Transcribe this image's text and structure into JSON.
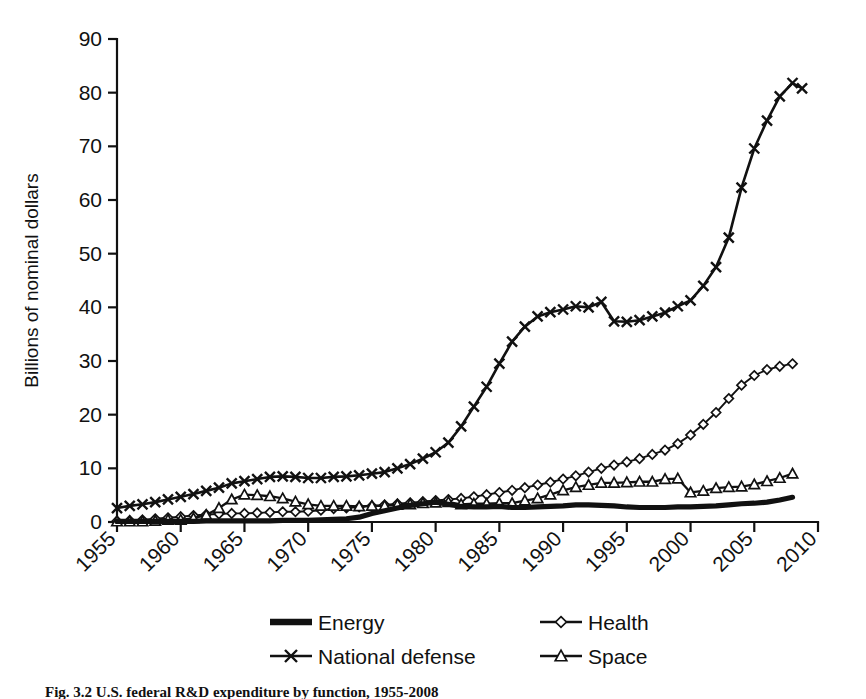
{
  "figure": {
    "background": "#ffffff",
    "ink_color": "#111111"
  },
  "axis": {
    "y_label": "Billions of nominal dollars",
    "y_ticks": [
      "0",
      "10",
      "20",
      "30",
      "40",
      "50",
      "60",
      "70",
      "80",
      "90"
    ],
    "x_ticks": [
      "1955",
      "1960",
      "1965",
      "1970",
      "1975",
      "1980",
      "1985",
      "1990",
      "1995",
      "2000",
      "2005",
      "2010"
    ]
  },
  "legend": {
    "entries": [
      {
        "label": "Energy",
        "marker": "thick-line",
        "column": 0,
        "row": 0
      },
      {
        "label": "Health",
        "marker": "diamond",
        "column": 1,
        "row": 0
      },
      {
        "label": "National defense",
        "marker": "cross-x",
        "column": 0,
        "row": 1
      },
      {
        "label": "Space",
        "marker": "triangle",
        "column": 1,
        "row": 1
      }
    ]
  },
  "caption": {
    "text": "Fig. 3.2   U.S. federal R&D expenditure by function, 1955-2008"
  },
  "chart_data": {
    "type": "line",
    "title": "",
    "xlabel": "",
    "ylabel": "Billions of nominal dollars",
    "xlim": [
      1955,
      2010
    ],
    "ylim": [
      0,
      90
    ],
    "ytick_step": 10,
    "xtick_step": 5,
    "grid": false,
    "legend_position": "bottom",
    "x": [
      1955,
      1956,
      1957,
      1958,
      1959,
      1960,
      1961,
      1962,
      1963,
      1964,
      1965,
      1966,
      1967,
      1968,
      1969,
      1970,
      1971,
      1972,
      1973,
      1974,
      1975,
      1976,
      1977,
      1978,
      1979,
      1980,
      1981,
      1982,
      1983,
      1984,
      1985,
      1986,
      1987,
      1988,
      1989,
      1990,
      1991,
      1992,
      1993,
      1994,
      1995,
      1996,
      1997,
      1998,
      1999,
      2000,
      2001,
      2002,
      2003,
      2004,
      2005,
      2006,
      2007,
      2008
    ],
    "series": [
      {
        "name": "National defense",
        "marker": "cross-x",
        "values": [
          2.6,
          3.0,
          3.3,
          3.7,
          4.2,
          4.7,
          5.2,
          5.8,
          6.4,
          7.2,
          7.6,
          8.0,
          8.4,
          8.5,
          8.4,
          8.2,
          8.2,
          8.4,
          8.5,
          8.7,
          9.0,
          9.3,
          10.0,
          10.8,
          11.8,
          13.0,
          14.8,
          17.8,
          21.5,
          25.2,
          29.5,
          33.6,
          36.4,
          38.3,
          39.1,
          39.6,
          40.2,
          40.0,
          41.0,
          37.4,
          37.3,
          37.6,
          38.3,
          39.0,
          40.2,
          41.3,
          44.0,
          47.5,
          53.0,
          62.3,
          69.6,
          74.8,
          79.3,
          81.8
        ],
        "end_value_after_peak": 80.8
      },
      {
        "name": "Health",
        "marker": "diamond",
        "values": [
          0.2,
          0.3,
          0.4,
          0.6,
          0.8,
          1.0,
          1.2,
          1.4,
          1.5,
          1.6,
          1.6,
          1.7,
          1.8,
          1.9,
          1.9,
          2.0,
          2.2,
          2.5,
          2.6,
          2.8,
          3.0,
          3.2,
          3.4,
          3.6,
          3.8,
          4.0,
          4.2,
          4.4,
          4.7,
          5.1,
          5.5,
          5.9,
          6.4,
          6.9,
          7.4,
          8.0,
          8.6,
          9.3,
          10.0,
          10.6,
          11.2,
          11.8,
          12.6,
          13.4,
          14.6,
          16.2,
          18.2,
          20.4,
          23.0,
          25.5,
          27.3,
          28.4,
          29.0,
          29.5
        ]
      },
      {
        "name": "Space",
        "marker": "triangle",
        "values": [
          0.1,
          0.1,
          0.1,
          0.2,
          0.4,
          0.4,
          0.7,
          1.3,
          2.6,
          4.2,
          5.1,
          5.0,
          4.8,
          4.4,
          3.8,
          3.3,
          3.0,
          3.0,
          3.0,
          2.9,
          3.0,
          3.0,
          3.2,
          3.3,
          3.5,
          3.6,
          3.7,
          3.3,
          3.4,
          3.4,
          3.5,
          3.5,
          4.0,
          4.4,
          5.1,
          5.9,
          6.5,
          6.9,
          7.3,
          7.3,
          7.4,
          7.5,
          7.5,
          8.0,
          8.1,
          5.5,
          5.8,
          6.3,
          6.5,
          6.6,
          7.0,
          7.6,
          8.2,
          9.0
        ]
      },
      {
        "name": "Energy",
        "marker": "thick-line",
        "values": [
          0.1,
          0.1,
          0.1,
          0.1,
          0.1,
          0.1,
          0.1,
          0.2,
          0.2,
          0.2,
          0.2,
          0.2,
          0.2,
          0.3,
          0.3,
          0.3,
          0.4,
          0.5,
          0.6,
          0.9,
          1.6,
          2.1,
          2.6,
          3.1,
          3.4,
          3.7,
          3.3,
          2.9,
          2.8,
          2.8,
          2.9,
          2.7,
          2.7,
          2.8,
          2.9,
          3.0,
          3.2,
          3.2,
          3.1,
          3.0,
          2.8,
          2.7,
          2.7,
          2.7,
          2.8,
          2.8,
          2.9,
          3.0,
          3.2,
          3.4,
          3.5,
          3.7,
          4.1,
          4.6
        ]
      }
    ]
  }
}
